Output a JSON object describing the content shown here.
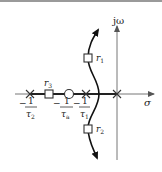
{
  "diagram": {
    "type": "root-locus",
    "axes": {
      "real_label": "σ",
      "imag_label": "jω"
    },
    "poles": [
      {
        "id": "p2",
        "label_num": "1",
        "label_den": "τ",
        "label_sub": "2",
        "sign": "−"
      },
      {
        "id": "p1",
        "label_num": "1",
        "label_den": "τ",
        "label_sub": "1",
        "sign": "−"
      },
      {
        "id": "p0",
        "location": "origin"
      }
    ],
    "zeros": [
      {
        "id": "za",
        "label_num": "1",
        "label_den": "τ",
        "label_sub": "a",
        "sign": "−"
      }
    ],
    "closed_loop_roots": [
      {
        "id": "r1",
        "label": "r",
        "sub": "1"
      },
      {
        "id": "r2",
        "label": "r",
        "sub": "2"
      },
      {
        "id": "r3",
        "label": "r",
        "sub": "3"
      }
    ],
    "colors": {
      "axis": "#555555",
      "locus": "#1a1a1a",
      "background": "#ffffff"
    }
  }
}
